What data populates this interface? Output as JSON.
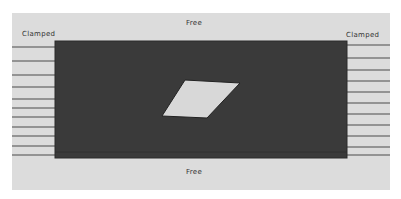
{
  "diagram": {
    "labels": {
      "top": "Free",
      "bottom": "Free",
      "left": "Clamped",
      "right": "Clamped"
    },
    "colors": {
      "background": "#ffffff",
      "panel": "#dcdcdc",
      "plate": "#3a3a3a",
      "crack": "#d8d8d8",
      "lines": "#4a4a4a"
    },
    "plate": {
      "x": 55,
      "y": 41,
      "width": 292,
      "height": 117
    },
    "crack_points": "162,116 185,80 240,83 207,118",
    "clamp_lines_y": [
      47,
      61,
      75,
      87,
      99,
      108,
      117,
      127,
      136,
      146,
      155
    ]
  }
}
